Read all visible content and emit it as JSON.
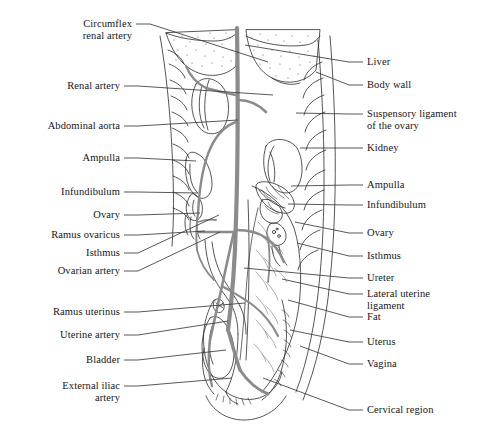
{
  "figure": {
    "style": "black-and-white line drawing with gray arterial vessels and stippled organ shading",
    "colors": {
      "outline": "#2b2b2b",
      "artery_gray": "#8b8b8b",
      "leader_line": "#3a3a3a",
      "stipple": "#6e6e6e",
      "background": "#ffffff",
      "text": "#161616"
    },
    "labels_left": [
      {
        "id": "circumflex-renal-artery",
        "lines": [
          "Circumflex",
          "renal artery"
        ],
        "x": 132,
        "y": 18,
        "anchor_x": 268,
        "anchor_y": 62
      },
      {
        "id": "renal-artery",
        "lines": [
          "Renal artery"
        ],
        "x": 120,
        "y": 80,
        "anchor_x": 273,
        "anchor_y": 95
      },
      {
        "id": "abdominal-aorta",
        "lines": [
          "Abdominal aorta"
        ],
        "x": 120,
        "y": 120,
        "anchor_x": 238,
        "anchor_y": 120
      },
      {
        "id": "ampulla-left",
        "lines": [
          "Ampulla"
        ],
        "x": 120,
        "y": 152,
        "anchor_x": 196,
        "anchor_y": 161
      },
      {
        "id": "infundibulum-left",
        "lines": [
          "Infundibulum"
        ],
        "x": 120,
        "y": 186,
        "anchor_x": 198,
        "anchor_y": 193
      },
      {
        "id": "ovary-left",
        "lines": [
          "Ovary"
        ],
        "x": 120,
        "y": 209,
        "anchor_x": 200,
        "anchor_y": 213
      },
      {
        "id": "ramus-ovaricus",
        "lines": [
          "Ramus ovaricus"
        ],
        "x": 120,
        "y": 229,
        "anchor_x": 205,
        "anchor_y": 231
      },
      {
        "id": "isthmus-left",
        "lines": [
          "Isthmus"
        ],
        "x": 120,
        "y": 247,
        "anchor_x": 219,
        "anchor_y": 215
      },
      {
        "id": "ovarian-artery",
        "lines": [
          "Ovarian artery"
        ],
        "x": 120,
        "y": 265,
        "anchor_x": 220,
        "anchor_y": 232
      },
      {
        "id": "ramus-uterinus",
        "lines": [
          "Ramus uterinus"
        ],
        "x": 120,
        "y": 306,
        "anchor_x": 245,
        "anchor_y": 303
      },
      {
        "id": "uterine-artery",
        "lines": [
          "Uterine artery"
        ],
        "x": 120,
        "y": 329,
        "anchor_x": 228,
        "anchor_y": 321
      },
      {
        "id": "bladder",
        "lines": [
          "Bladder"
        ],
        "x": 120,
        "y": 354,
        "anchor_x": 226,
        "anchor_y": 350
      },
      {
        "id": "external-iliac-artery",
        "lines": [
          "External iliac",
          "artery"
        ],
        "x": 120,
        "y": 380,
        "anchor_x": 232,
        "anchor_y": 378
      }
    ],
    "labels_right": [
      {
        "id": "liver",
        "lines": [
          "Liver"
        ],
        "x": 367,
        "y": 56,
        "anchor_x": 245,
        "anchor_y": 45
      },
      {
        "id": "body-wall",
        "lines": [
          "Body wall"
        ],
        "x": 367,
        "y": 79,
        "anchor_x": 316,
        "anchor_y": 72
      },
      {
        "id": "suspensory-ligament",
        "lines": [
          "Suspensory ligament",
          "of the ovary"
        ],
        "x": 367,
        "y": 108,
        "anchor_x": 296,
        "anchor_y": 113
      },
      {
        "id": "kidney",
        "lines": [
          "Kidney"
        ],
        "x": 367,
        "y": 142,
        "anchor_x": 300,
        "anchor_y": 148
      },
      {
        "id": "ampulla-right",
        "lines": [
          "Ampulla"
        ],
        "x": 367,
        "y": 179,
        "anchor_x": 291,
        "anchor_y": 186
      },
      {
        "id": "infundibulum-right",
        "lines": [
          "Infundibulum"
        ],
        "x": 367,
        "y": 199,
        "anchor_x": 288,
        "anchor_y": 204
      },
      {
        "id": "ovary-right",
        "lines": [
          "Ovary"
        ],
        "x": 367,
        "y": 227,
        "anchor_x": 295,
        "anchor_y": 222
      },
      {
        "id": "isthmus-right",
        "lines": [
          "Isthmus"
        ],
        "x": 367,
        "y": 250,
        "anchor_x": 297,
        "anchor_y": 243
      },
      {
        "id": "ureter",
        "lines": [
          "Ureter"
        ],
        "x": 367,
        "y": 272,
        "anchor_x": 244,
        "anchor_y": 268
      },
      {
        "id": "lateral-uterine-ligament",
        "lines": [
          "Lateral uterine",
          "ligament"
        ],
        "x": 367,
        "y": 288,
        "anchor_x": 282,
        "anchor_y": 279
      },
      {
        "id": "fat",
        "lines": [
          "Fat"
        ],
        "x": 367,
        "y": 311,
        "anchor_x": 288,
        "anchor_y": 300
      },
      {
        "id": "uterus",
        "lines": [
          "Uterus"
        ],
        "x": 367,
        "y": 336,
        "anchor_x": 290,
        "anchor_y": 330
      },
      {
        "id": "vagina",
        "lines": [
          "Vagina"
        ],
        "x": 367,
        "y": 358,
        "anchor_x": 300,
        "anchor_y": 346
      },
      {
        "id": "cervical-region",
        "lines": [
          "Cervical region"
        ],
        "x": 367,
        "y": 404,
        "anchor_x": 263,
        "anchor_y": 378
      }
    ]
  }
}
